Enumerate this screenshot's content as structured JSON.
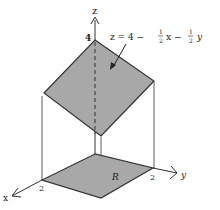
{
  "figure": {
    "axes": {
      "x_label": "x",
      "y_label": "y",
      "z_label": "z"
    },
    "ticks": {
      "x_tick": "2",
      "y_tick": "2",
      "z_tick": "4"
    },
    "region_label": "R",
    "equation": {
      "lhs": "z = 4 − ",
      "frac1_num": "1",
      "frac1_den": "2",
      "mid": "x − ",
      "frac2_num": "1",
      "frac2_den": "2",
      "end": "y"
    },
    "colors": {
      "surface_fill": "#a8a8a8",
      "edge": "#333333",
      "background": "#ffffff"
    }
  }
}
